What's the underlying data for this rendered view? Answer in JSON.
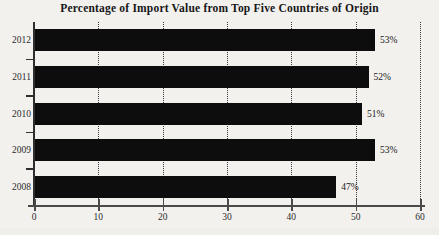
{
  "chart_data": {
    "type": "bar",
    "orientation": "horizontal",
    "title": "Percentage of Import Value from Top Five Countries of Origin",
    "xlabel": "",
    "ylabel": "",
    "categories": [
      "2012",
      "2011",
      "2010",
      "2009",
      "2008"
    ],
    "values": [
      53,
      52,
      51,
      53,
      47
    ],
    "data_labels": [
      "53%",
      "52%",
      "51%",
      "53%",
      "47%"
    ],
    "xlim": [
      0,
      60
    ],
    "x_ticks": [
      0,
      10,
      20,
      30,
      40,
      50,
      60
    ],
    "x_tick_labels": [
      "0",
      "10",
      "20",
      "30",
      "40",
      "50",
      "60"
    ],
    "grid": true,
    "grid_axis": "x",
    "grid_style": "dotted",
    "legend": false,
    "bar_color": "#0d0d0d",
    "background_color": "#f2f1ee",
    "axis_color": "#2e2e2e",
    "series": [
      {
        "name": "Percentage of Import Value",
        "values": [
          53,
          52,
          51,
          53,
          47
        ]
      }
    ]
  }
}
